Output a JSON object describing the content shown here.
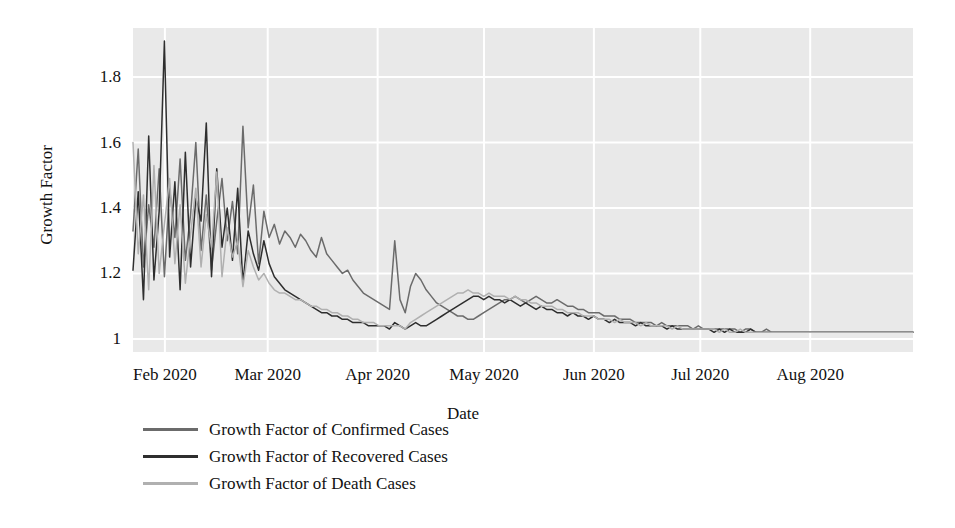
{
  "chart_data": {
    "type": "line",
    "title": "",
    "xlabel": "Date",
    "ylabel": "Growth Factor",
    "grid": true,
    "legend_position": "below-left",
    "plot_background": "#e9e9e9",
    "gridline_color": "#ffffff",
    "ylim": [
      0.96,
      1.95
    ],
    "yticks": [
      1,
      1.2,
      1.4,
      1.6,
      1.8
    ],
    "ytick_labels": [
      "1",
      "1.2",
      "1.4",
      "1.6",
      "1.8"
    ],
    "xticks": [
      "Feb 2020",
      "Mar 2020",
      "Apr 2020",
      "May 2020",
      "Jun 2020",
      "Jul 2020",
      "Aug 2020"
    ],
    "xlim": [
      "2020-01-23",
      "2020-08-29"
    ],
    "series": [
      {
        "name": "Growth Factor of Confirmed Cases",
        "color": "#6b6b6b",
        "values": [
          1.33,
          1.58,
          1.22,
          1.41,
          1.28,
          1.52,
          1.19,
          1.46,
          1.31,
          1.55,
          1.24,
          1.38,
          1.6,
          1.27,
          1.44,
          1.21,
          1.36,
          1.49,
          1.3,
          1.42,
          1.26,
          1.65,
          1.34,
          1.47,
          1.23,
          1.39,
          1.31,
          1.35,
          1.29,
          1.33,
          1.31,
          1.28,
          1.32,
          1.3,
          1.27,
          1.25,
          1.31,
          1.26,
          1.24,
          1.22,
          1.2,
          1.21,
          1.18,
          1.16,
          1.14,
          1.13,
          1.12,
          1.11,
          1.1,
          1.09,
          1.3,
          1.12,
          1.08,
          1.16,
          1.2,
          1.18,
          1.15,
          1.13,
          1.11,
          1.1,
          1.09,
          1.08,
          1.07,
          1.07,
          1.06,
          1.06,
          1.07,
          1.08,
          1.09,
          1.1,
          1.11,
          1.12,
          1.12,
          1.13,
          1.12,
          1.11,
          1.12,
          1.13,
          1.12,
          1.11,
          1.11,
          1.12,
          1.11,
          1.1,
          1.1,
          1.09,
          1.09,
          1.08,
          1.08,
          1.08,
          1.07,
          1.07,
          1.07,
          1.06,
          1.06,
          1.06,
          1.05,
          1.05,
          1.05,
          1.05,
          1.04,
          1.05,
          1.04,
          1.04,
          1.04,
          1.04,
          1.04,
          1.03,
          1.04,
          1.03,
          1.03,
          1.03,
          1.03,
          1.03,
          1.03,
          1.03,
          1.02,
          1.03,
          1.03,
          1.02,
          1.02,
          1.03,
          1.02,
          1.02,
          1.02,
          1.02,
          1.02,
          1.02,
          1.02,
          1.02,
          1.02,
          1.02,
          1.02,
          1.02,
          1.02,
          1.02,
          1.02,
          1.02,
          1.02,
          1.02,
          1.02,
          1.02,
          1.02,
          1.02,
          1.02,
          1.02,
          1.02,
          1.02,
          1.02,
          1.02
        ]
      },
      {
        "name": "Growth Factor of Recovered Cases",
        "color": "#2e2e2e",
        "values": [
          1.21,
          1.45,
          1.12,
          1.62,
          1.18,
          1.39,
          1.91,
          1.25,
          1.48,
          1.15,
          1.57,
          1.22,
          1.43,
          1.36,
          1.66,
          1.19,
          1.52,
          1.28,
          1.4,
          1.24,
          1.46,
          1.17,
          1.33,
          1.26,
          1.21,
          1.3,
          1.23,
          1.19,
          1.17,
          1.15,
          1.14,
          1.13,
          1.12,
          1.11,
          1.1,
          1.09,
          1.08,
          1.08,
          1.07,
          1.07,
          1.06,
          1.06,
          1.05,
          1.05,
          1.05,
          1.04,
          1.04,
          1.04,
          1.04,
          1.03,
          1.05,
          1.04,
          1.03,
          1.04,
          1.05,
          1.04,
          1.04,
          1.05,
          1.06,
          1.07,
          1.08,
          1.09,
          1.1,
          1.11,
          1.12,
          1.13,
          1.13,
          1.12,
          1.13,
          1.12,
          1.12,
          1.11,
          1.12,
          1.11,
          1.1,
          1.11,
          1.1,
          1.09,
          1.1,
          1.09,
          1.09,
          1.08,
          1.08,
          1.07,
          1.08,
          1.07,
          1.07,
          1.06,
          1.07,
          1.06,
          1.06,
          1.05,
          1.06,
          1.05,
          1.05,
          1.05,
          1.04,
          1.05,
          1.04,
          1.04,
          1.04,
          1.04,
          1.03,
          1.04,
          1.03,
          1.03,
          1.03,
          1.03,
          1.03,
          1.03,
          1.03,
          1.02,
          1.03,
          1.02,
          1.03,
          1.02,
          1.02,
          1.02,
          1.03,
          1.02,
          1.02,
          1.02,
          1.02,
          1.02,
          1.02,
          1.02,
          1.02,
          1.02,
          1.02,
          1.02,
          1.02,
          1.02,
          1.02,
          1.02,
          1.02,
          1.02,
          1.02,
          1.02,
          1.02,
          1.02,
          1.02,
          1.02,
          1.02,
          1.02,
          1.02,
          1.02,
          1.02,
          1.02,
          1.02,
          1.02
        ]
      },
      {
        "name": "Growth Factor of Death Cases",
        "color": "#b0b0b0",
        "values": [
          1.6,
          1.26,
          1.44,
          1.15,
          1.53,
          1.2,
          1.35,
          1.49,
          1.23,
          1.41,
          1.17,
          1.32,
          1.46,
          1.22,
          1.38,
          1.28,
          1.51,
          1.19,
          1.34,
          1.25,
          1.3,
          1.16,
          1.27,
          1.22,
          1.18,
          1.2,
          1.17,
          1.15,
          1.14,
          1.14,
          1.13,
          1.12,
          1.12,
          1.11,
          1.1,
          1.1,
          1.09,
          1.09,
          1.08,
          1.08,
          1.07,
          1.07,
          1.06,
          1.06,
          1.05,
          1.05,
          1.05,
          1.04,
          1.04,
          1.04,
          1.04,
          1.04,
          1.03,
          1.05,
          1.06,
          1.07,
          1.08,
          1.09,
          1.1,
          1.11,
          1.12,
          1.13,
          1.14,
          1.14,
          1.15,
          1.14,
          1.14,
          1.13,
          1.14,
          1.13,
          1.13,
          1.13,
          1.12,
          1.13,
          1.12,
          1.12,
          1.11,
          1.11,
          1.1,
          1.1,
          1.1,
          1.09,
          1.09,
          1.08,
          1.08,
          1.08,
          1.07,
          1.07,
          1.07,
          1.06,
          1.06,
          1.06,
          1.05,
          1.06,
          1.05,
          1.05,
          1.05,
          1.04,
          1.05,
          1.04,
          1.04,
          1.04,
          1.04,
          1.03,
          1.04,
          1.03,
          1.03,
          1.03,
          1.03,
          1.03,
          1.03,
          1.03,
          1.02,
          1.03,
          1.02,
          1.02,
          1.03,
          1.02,
          1.02,
          1.02,
          1.02,
          1.02,
          1.02,
          1.02,
          1.02,
          1.02,
          1.02,
          1.02,
          1.02,
          1.02,
          1.02,
          1.02,
          1.02,
          1.02,
          1.02,
          1.02,
          1.02,
          1.02,
          1.02,
          1.02,
          1.02,
          1.02,
          1.02,
          1.02,
          1.02,
          1.02,
          1.02,
          1.02,
          1.02,
          1.02
        ]
      }
    ]
  },
  "legend": {
    "items": [
      {
        "label": "Growth Factor of Confirmed Cases",
        "color": "#6b6b6b"
      },
      {
        "label": "Growth Factor of Recovered Cases",
        "color": "#2e2e2e"
      },
      {
        "label": "Growth Factor of Death Cases",
        "color": "#b0b0b0"
      }
    ]
  }
}
